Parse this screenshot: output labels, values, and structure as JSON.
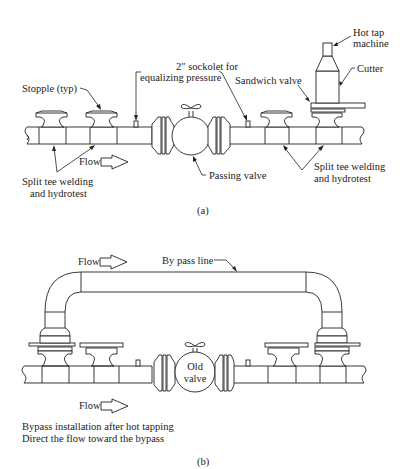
{
  "figure_a": {
    "caption": "(a)",
    "labels": {
      "hot_tap_line1": "Hot tap",
      "hot_tap_line2": "machine",
      "cutter": "Cutter",
      "sockolet_line1": "2″ sockolet for",
      "sockolet_line2": "equalizing pressure",
      "stopple": "Stopple (typ)",
      "sandwich_valve": "Sandwich valve",
      "flow": "Flow",
      "passing_valve": "Passing valve",
      "split_tee_left_line1": "Split tee welding",
      "split_tee_left_line2": "and hydrotest",
      "split_tee_right_line1": "Split tee welding",
      "split_tee_right_line2": "and hydrotest"
    }
  },
  "figure_b": {
    "caption": "(b)",
    "labels": {
      "flow_top": "Flow",
      "bypass_line": "By pass line",
      "old_valve_line1": "Old",
      "old_valve_line2": "valve",
      "flow_bottom": "Flow",
      "note_line1": "Bypass installation after hot tapping",
      "note_line2": "Direct the flow toward the bypass"
    }
  }
}
